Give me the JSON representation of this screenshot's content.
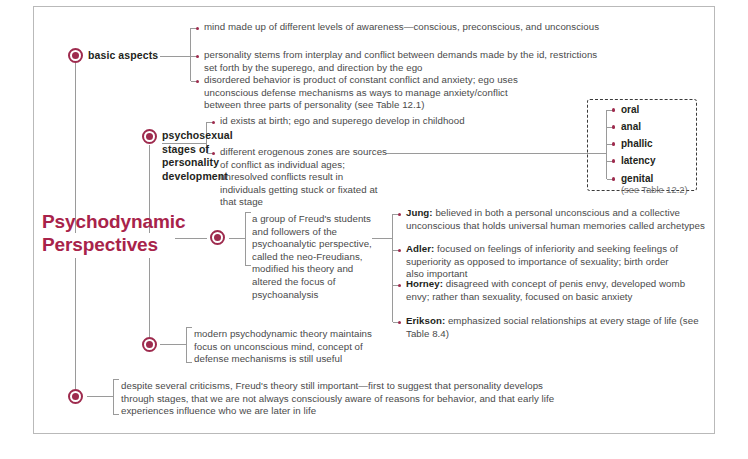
{
  "title": {
    "line1": "Psychodynamic",
    "line2": "Perspectives"
  },
  "colors": {
    "accent": "#9e2b4e",
    "title": "#a8234a",
    "body_text": "#4a4a4a",
    "heading_text": "#231f20",
    "frame_border": "#b9b9b9",
    "connector": "#9a9a9a",
    "dashed_box": "#3b3b3b"
  },
  "branches": [
    {
      "id": "basic-aspects",
      "label": "basic aspects",
      "items": [
        {
          "text": "mind made up of different levels of awareness—conscious, preconscious, and unconscious"
        },
        {
          "text": "personality stems from interplay and conflict between demands made by the id, restrictions set forth by the superego, and direction by the ego"
        },
        {
          "text": "disordered behavior is product of constant conflict and anxiety; ego uses unconscious defense mechanisms as ways to manage anxiety/conflict between three parts of personality (see Table 12.1)"
        }
      ]
    },
    {
      "id": "psychosexual-stages",
      "label": "psychosexual stages of personality development",
      "items": [
        {
          "text": "id exists at birth; ego and superego develop in childhood"
        },
        {
          "text": "different erogenous zones are sources of conflict as individual ages; unresolved conflicts result in individuals getting stuck or fixated at that stage"
        }
      ]
    },
    {
      "id": "neo-freudians",
      "label": "",
      "items": [
        {
          "text": "a group of Freud's students and followers of the psychoanalytic perspective, called the neo-Freudians, modified his theory and altered the focus of psychoanalysis"
        }
      ]
    },
    {
      "id": "modern-psychodynamic",
      "label": "",
      "items": [
        {
          "text": "modern psychodynamic theory maintains focus on unconscious mind, concept of defense mechanisms is still useful"
        }
      ]
    },
    {
      "id": "criticisms",
      "label": "",
      "items": [
        {
          "text": "despite several criticisms, Freud's theory still important—first to suggest that personality develops through stages, that we are not always consciously aware of reasons for behavior, and that early life experiences influence who we are later in life"
        }
      ]
    }
  ],
  "stages_box": {
    "items": [
      "oral",
      "anal",
      "phallic",
      "latency",
      "genital"
    ],
    "note": "(see Table 12.2)"
  },
  "theorists": [
    {
      "name": "Jung:",
      "description": "believed in both a personal unconscious and a collective unconscious that holds universal human memories called archetypes"
    },
    {
      "name": "Adler:",
      "description": "focused on feelings of inferiority and seeking feelings of superiority as opposed to importance of sexuality; birth order also important"
    },
    {
      "name": "Horney:",
      "description": "disagreed with concept of penis envy, developed womb envy; rather than sexuality, focused on basic anxiety"
    },
    {
      "name": "Erikson:",
      "description": "emphasized social relationships at every stage of life (see Table 8.4)"
    }
  ]
}
